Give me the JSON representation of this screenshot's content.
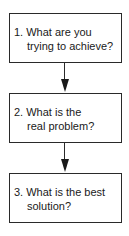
{
  "diagram": {
    "type": "flowchart",
    "direction": "top-to-bottom",
    "steps": [
      {
        "number": "1.",
        "line1": "1. What are you",
        "line2": "trying to achieve?"
      },
      {
        "number": "2.",
        "line1": "2. What is the",
        "line2": "real problem?"
      },
      {
        "number": "3.",
        "line1": "3. What is the best",
        "line2": "solution?"
      }
    ],
    "edges": [
      {
        "from": 0,
        "to": 1
      },
      {
        "from": 1,
        "to": 2
      }
    ],
    "colors": {
      "stroke": "#2a2a2a",
      "background": "#ffffff",
      "text": "#1a1a1a"
    }
  }
}
